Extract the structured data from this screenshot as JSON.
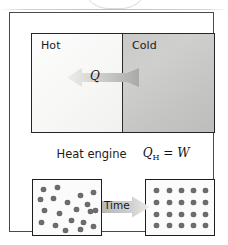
{
  "figure": {
    "top_panel": {
      "hot_label": "Hot",
      "cold_label": "Cold",
      "heat_symbol": "Q",
      "arrow_direction": "left",
      "hot_color": "#f7f7f6",
      "cold_color": "#c7c7c5"
    },
    "caption": {
      "text": "Heat engine",
      "formula_q": "Q",
      "formula_sub": "H",
      "formula_rest": " = ",
      "formula_w": "W"
    },
    "bottom_panel": {
      "time_label": "Time",
      "arrow_direction": "right",
      "dot_color": "#6d6d6d",
      "disordered": {
        "count": 20,
        "dots": [
          [
            8,
            7
          ],
          [
            22,
            5
          ],
          [
            5,
            17
          ],
          [
            18,
            16
          ],
          [
            45,
            13
          ],
          [
            58,
            10
          ],
          [
            32,
            20
          ],
          [
            52,
            22
          ],
          [
            9,
            28
          ],
          [
            24,
            31
          ],
          [
            41,
            27
          ],
          [
            55,
            29
          ],
          [
            60,
            28
          ],
          [
            6,
            40
          ],
          [
            20,
            43
          ],
          [
            36,
            38
          ],
          [
            48,
            40
          ],
          [
            30,
            48
          ],
          [
            45,
            47
          ],
          [
            58,
            44
          ]
        ]
      },
      "ordered": {
        "count": 20,
        "rows": 4,
        "columns": 5,
        "x_positions": [
          8,
          21,
          33,
          45,
          57
        ],
        "y_positions": [
          8,
          20,
          32,
          43
        ]
      }
    }
  },
  "artifacts": {
    "top_chevron": "chevron-down-decoration"
  }
}
